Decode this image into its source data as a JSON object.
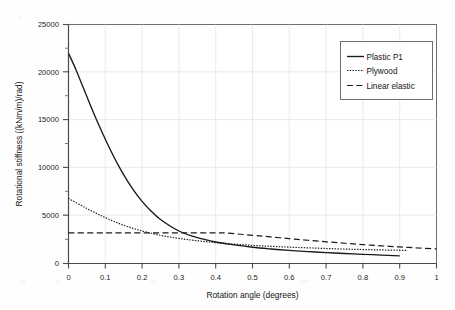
{
  "chart_data": {
    "type": "line",
    "title": "",
    "xlabel": "Rotation angle (degrees)",
    "ylabel": "Rotational stiffness ((kNm/m)/rad)",
    "xlim": [
      0,
      1
    ],
    "ylim": [
      0,
      25000
    ],
    "xticks": [
      "0",
      "0.1",
      "0.2",
      "0.3",
      "0.4",
      "0.5",
      "0.6",
      "0.7",
      "0.8",
      "0.9",
      "1"
    ],
    "xtick_values": [
      0,
      0.1,
      0.2,
      0.3,
      0.4,
      0.5,
      0.6,
      0.7,
      0.8,
      0.9,
      1
    ],
    "yticks": [
      "0",
      "5000",
      "10000",
      "15000",
      "20000",
      "25000"
    ],
    "ytick_values": [
      0,
      5000,
      10000,
      15000,
      20000,
      25000
    ],
    "grid": true,
    "legend_position": "upper right",
    "series": [
      {
        "name": "Plastic P1",
        "style": "solid",
        "color": "#1a1a1a",
        "x": [
          0,
          0.02,
          0.04,
          0.06,
          0.08,
          0.1,
          0.12,
          0.14,
          0.16,
          0.18,
          0.2,
          0.22,
          0.25,
          0.3,
          0.35,
          0.4,
          0.45,
          0.5,
          0.55,
          0.6,
          0.65,
          0.7,
          0.75,
          0.8,
          0.85,
          0.9
        ],
        "values": [
          22000,
          20300,
          18400,
          16500,
          14700,
          13000,
          11400,
          9950,
          8650,
          7500,
          6500,
          5650,
          4600,
          3400,
          2700,
          2250,
          1950,
          1700,
          1520,
          1370,
          1250,
          1140,
          1050,
          960,
          880,
          800
        ]
      },
      {
        "name": "Plywood",
        "style": "dotted",
        "color": "#1a1a1a",
        "x": [
          0,
          0.05,
          0.1,
          0.15,
          0.2,
          0.25,
          0.3,
          0.35,
          0.4,
          0.45,
          0.5,
          0.55,
          0.6,
          0.65,
          0.7,
          0.75,
          0.8,
          0.85,
          0.9,
          0.92
        ],
        "values": [
          6800,
          5750,
          4800,
          4000,
          3400,
          2950,
          2620,
          2380,
          2180,
          2030,
          1900,
          1800,
          1710,
          1640,
          1570,
          1510,
          1460,
          1420,
          1380,
          1370
        ]
      },
      {
        "name": "Linear elastic",
        "style": "dashed",
        "color": "#1a1a1a",
        "x": [
          0,
          0.1,
          0.2,
          0.3,
          0.4,
          0.43,
          0.5,
          0.55,
          0.6,
          0.65,
          0.7,
          0.75,
          0.8,
          0.85,
          0.9,
          0.95,
          1
        ],
        "values": [
          3200,
          3200,
          3200,
          3200,
          3200,
          3180,
          2950,
          2780,
          2600,
          2430,
          2270,
          2120,
          1980,
          1850,
          1730,
          1620,
          1520
        ]
      }
    ]
  },
  "legend": {
    "items": [
      {
        "label": "Plastic P1"
      },
      {
        "label": "Plywood"
      },
      {
        "label": "Linear elastic"
      }
    ]
  },
  "axes": {
    "x_title": "Rotation angle (degrees)",
    "y_title": "Rotational stiffness ((kNm/m)/rad)"
  }
}
